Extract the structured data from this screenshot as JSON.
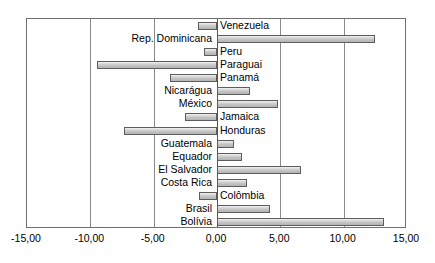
{
  "chart_data": {
    "type": "bar",
    "orientation": "horizontal",
    "title": "",
    "subtitle": "",
    "xlabel": "",
    "ylabel": "",
    "xlim": [
      -15.0,
      15.0
    ],
    "xticks": [
      -15.0,
      -10.0,
      -5.0,
      0.0,
      5.0,
      10.0,
      15.0
    ],
    "xtick_labels": [
      "-15,00",
      "-10,00",
      "-5,00",
      "0,00",
      "5,00",
      "10,00",
      "15,00"
    ],
    "grid": true,
    "legend": null,
    "bar_fill": "#cccccc",
    "bar_edge": "#5d5d5d",
    "categories": [
      "Venezuela",
      "Rep. Dominicana",
      "Peru",
      "Paraguai",
      "Panamá",
      "Nicarágua",
      "México",
      "Jamaica",
      "Honduras",
      "Guatemala",
      "Equador",
      "El Salvador",
      "Costa Rica",
      "Colômbia",
      "Brasil",
      "Bolívia"
    ],
    "values": [
      -1.5,
      12.45,
      -1.05,
      -9.5,
      -3.7,
      2.6,
      4.85,
      -2.55,
      -7.35,
      1.35,
      2.0,
      6.6,
      2.4,
      -1.45,
      4.2,
      13.2
    ]
  }
}
